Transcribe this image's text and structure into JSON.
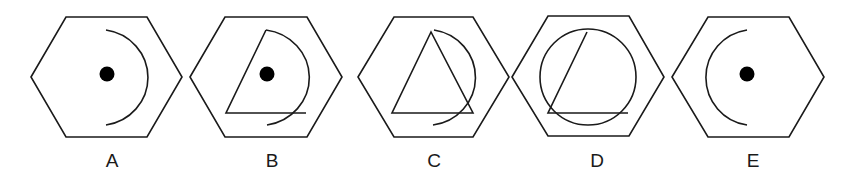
{
  "figures": [
    {
      "label": "A",
      "description": "hexagon with dot and right-facing arc"
    },
    {
      "label": "B",
      "description": "hexagon with dot, arc and open triangle"
    },
    {
      "label": "C",
      "description": "hexagon with triangle and arc"
    },
    {
      "label": "D",
      "description": "hexagon with circle and open triangle"
    },
    {
      "label": "E",
      "description": "hexagon with dot and left-facing arc"
    }
  ],
  "colors": {
    "stroke": "#1a1a1a",
    "background": "#ffffff"
  }
}
